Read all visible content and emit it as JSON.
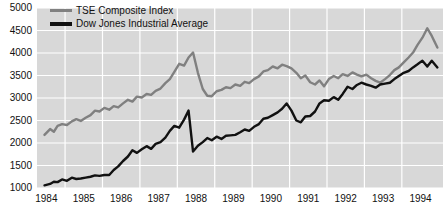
{
  "chart_data": {
    "type": "line",
    "title": "",
    "subtitle": "",
    "xlabel": "",
    "ylabel": "",
    "xlim": [
      1983.75,
      1994.6
    ],
    "ylim": [
      1000,
      5000
    ],
    "grid": true,
    "legend_position": "top-left",
    "plot_background_color": "#d8d8d8",
    "grid_color": "#ffffff",
    "figure_background_color": "#ffffff",
    "ytick_labels": [
      "5000",
      "4500",
      "4000",
      "3500",
      "3000",
      "2500",
      "2000",
      "1500",
      "1000"
    ],
    "ytick_values": [
      5000,
      4500,
      4000,
      3500,
      3000,
      2500,
      2000,
      1500,
      1000
    ],
    "xtick_labels": [
      "1984",
      "1985",
      "1986",
      "1987",
      "1988",
      "1989",
      "1990",
      "1991",
      "1992",
      "1993",
      "1994"
    ],
    "xtick_values": [
      1984,
      1985,
      1986,
      1987,
      1988,
      1989,
      1990,
      1991,
      1992,
      1993,
      1994
    ],
    "legend": [
      {
        "name": "TSE Composite Index",
        "color": "#808080",
        "line_width": 3
      },
      {
        "name": "Dow Jones Industrial Average",
        "color": "#111111",
        "line_width": 4
      }
    ],
    "series": [
      {
        "name": "TSE Composite Index",
        "color": "#808080",
        "line_width": 2.4,
        "x": [
          1983.95,
          1984.1,
          1984.2,
          1984.3,
          1984.42,
          1984.55,
          1984.68,
          1984.8,
          1984.92,
          1985.05,
          1985.18,
          1985.3,
          1985.42,
          1985.55,
          1985.68,
          1985.8,
          1985.92,
          1986.05,
          1986.18,
          1986.3,
          1986.42,
          1986.55,
          1986.68,
          1986.8,
          1986.92,
          1987.05,
          1987.18,
          1987.3,
          1987.42,
          1987.55,
          1987.68,
          1987.8,
          1987.92,
          1988.05,
          1988.18,
          1988.3,
          1988.42,
          1988.55,
          1988.68,
          1988.8,
          1988.92,
          1989.05,
          1989.18,
          1989.3,
          1989.42,
          1989.55,
          1989.68,
          1989.8,
          1989.92,
          1990.05,
          1990.18,
          1990.3,
          1990.42,
          1990.55,
          1990.68,
          1990.8,
          1990.92,
          1991.05,
          1991.18,
          1991.3,
          1991.42,
          1991.55,
          1991.68,
          1991.8,
          1991.92,
          1992.05,
          1992.18,
          1992.3,
          1992.42,
          1992.55,
          1992.68,
          1992.8,
          1992.92,
          1993.05,
          1993.18,
          1993.3,
          1993.42,
          1993.55,
          1993.68,
          1993.8,
          1993.92,
          1994.05,
          1994.18,
          1994.3,
          1994.45
        ],
        "y": [
          2180,
          2310,
          2250,
          2380,
          2420,
          2400,
          2480,
          2530,
          2490,
          2560,
          2620,
          2720,
          2700,
          2780,
          2740,
          2820,
          2790,
          2880,
          2960,
          2920,
          3030,
          3010,
          3090,
          3070,
          3160,
          3210,
          3330,
          3420,
          3580,
          3760,
          3720,
          3900,
          4010,
          3560,
          3200,
          3050,
          3040,
          3150,
          3180,
          3240,
          3220,
          3300,
          3270,
          3360,
          3330,
          3420,
          3480,
          3590,
          3620,
          3700,
          3660,
          3740,
          3710,
          3660,
          3560,
          3440,
          3500,
          3350,
          3300,
          3390,
          3260,
          3420,
          3490,
          3440,
          3530,
          3490,
          3570,
          3520,
          3480,
          3520,
          3440,
          3380,
          3340,
          3420,
          3510,
          3620,
          3680,
          3790,
          3900,
          4010,
          4180,
          4340,
          4550,
          4380,
          4120
        ]
      },
      {
        "name": "Dow Jones Industrial Average",
        "color": "#111111",
        "line_width": 2.4,
        "x": [
          1983.95,
          1984.1,
          1984.2,
          1984.3,
          1984.42,
          1984.55,
          1984.68,
          1984.8,
          1984.92,
          1985.05,
          1985.18,
          1985.3,
          1985.42,
          1985.55,
          1985.68,
          1985.8,
          1985.92,
          1986.05,
          1986.18,
          1986.3,
          1986.42,
          1986.55,
          1986.68,
          1986.8,
          1986.92,
          1987.05,
          1987.18,
          1987.3,
          1987.42,
          1987.55,
          1987.68,
          1987.8,
          1987.92,
          1988.05,
          1988.18,
          1988.3,
          1988.42,
          1988.55,
          1988.68,
          1988.8,
          1988.92,
          1989.05,
          1989.18,
          1989.3,
          1989.42,
          1989.55,
          1989.68,
          1989.8,
          1989.92,
          1990.05,
          1990.18,
          1990.3,
          1990.42,
          1990.55,
          1990.68,
          1990.8,
          1990.92,
          1991.05,
          1991.18,
          1991.3,
          1991.42,
          1991.55,
          1991.68,
          1991.8,
          1991.92,
          1992.05,
          1992.18,
          1992.3,
          1992.42,
          1992.55,
          1992.68,
          1992.8,
          1992.92,
          1993.05,
          1993.18,
          1993.3,
          1993.42,
          1993.55,
          1993.68,
          1993.8,
          1993.92,
          1994.05,
          1994.18,
          1994.3,
          1994.45
        ],
        "y": [
          1060,
          1090,
          1140,
          1130,
          1190,
          1160,
          1230,
          1200,
          1210,
          1230,
          1250,
          1280,
          1270,
          1290,
          1290,
          1400,
          1480,
          1600,
          1700,
          1840,
          1780,
          1860,
          1930,
          1870,
          1980,
          2020,
          2120,
          2270,
          2380,
          2340,
          2520,
          2720,
          1810,
          1940,
          2020,
          2110,
          2060,
          2140,
          2090,
          2160,
          2170,
          2180,
          2240,
          2300,
          2270,
          2360,
          2420,
          2540,
          2560,
          2620,
          2680,
          2760,
          2880,
          2720,
          2500,
          2460,
          2590,
          2600,
          2700,
          2880,
          2950,
          2940,
          3020,
          2960,
          3090,
          3250,
          3200,
          3290,
          3340,
          3300,
          3270,
          3230,
          3300,
          3320,
          3340,
          3420,
          3490,
          3560,
          3600,
          3680,
          3750,
          3830,
          3700,
          3830,
          3680
        ]
      }
    ]
  },
  "legend": {
    "items": [
      {
        "label": "TSE Composite Index"
      },
      {
        "label": "Dow Jones Industrial Average"
      }
    ]
  }
}
